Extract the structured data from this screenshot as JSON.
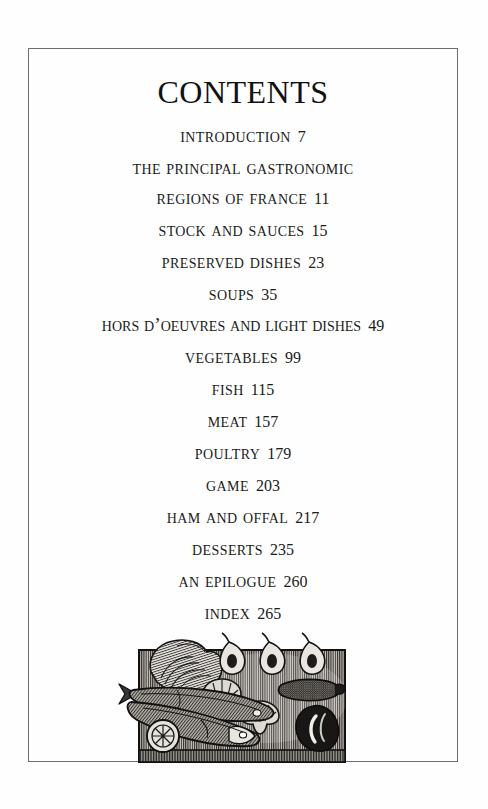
{
  "page": {
    "title": "Contents",
    "border_color": "#6e6e6e",
    "background_color": "#fefefe",
    "text_color": "#1b1b1b"
  },
  "toc": {
    "entries": [
      {
        "label": "Introduction",
        "page": "7"
      },
      {
        "label": "The principal gastronomic regions of France",
        "line1": "The principal gastronomic",
        "line2": "regions of France",
        "page": "11"
      },
      {
        "label": "Stock and sauces",
        "page": "15"
      },
      {
        "label": "Preserved dishes",
        "page": "23"
      },
      {
        "label": "Soups",
        "page": "35"
      },
      {
        "label": "Hors d’oeuvres and light dishes",
        "page": "49"
      },
      {
        "label": "Vegetables",
        "page": "99"
      },
      {
        "label": "Fish",
        "page": "115"
      },
      {
        "label": "Meat",
        "page": "157"
      },
      {
        "label": "Poultry",
        "page": "179"
      },
      {
        "label": "Game",
        "page": "203"
      },
      {
        "label": "Ham and offal",
        "page": "217"
      },
      {
        "label": "Desserts",
        "page": "235"
      },
      {
        "label": "An epilogue",
        "page": "260"
      },
      {
        "label": "Index",
        "page": "265"
      }
    ]
  },
  "illustration": {
    "name": "cutting-board-with-food-engraving",
    "description": "Wood-engraving of a rectangular cutting board holding food",
    "items": [
      "cabbage-lettuce-head",
      "chili-pepper",
      "chili-pepper",
      "chili-pepper",
      "mushroom",
      "mushroom",
      "sausage",
      "kidney-bean",
      "fish",
      "fish",
      "lemon-slice"
    ],
    "board_color": "#3a3a3a"
  }
}
